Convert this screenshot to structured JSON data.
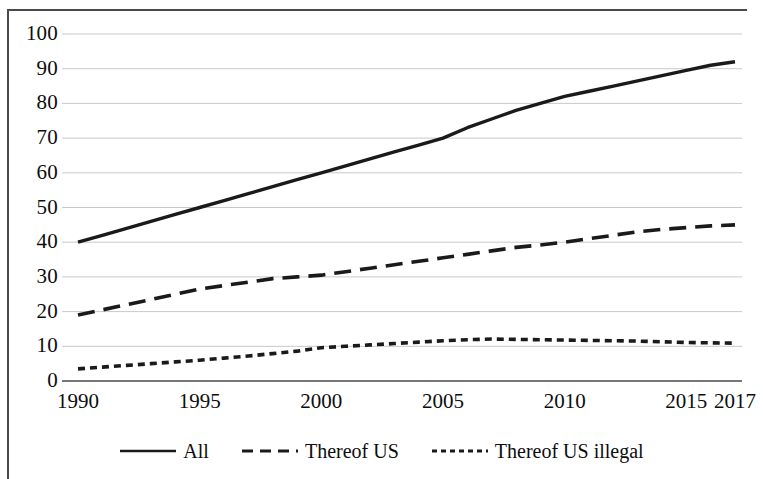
{
  "chart_data": {
    "type": "line",
    "title": "",
    "xlabel": "",
    "ylabel": "",
    "xlim": [
      1990,
      2017
    ],
    "ylim": [
      0,
      100
    ],
    "grid": true,
    "legend_position": "bottom",
    "x_tick_labels": [
      "1990",
      "1995",
      "2000",
      "2005",
      "2010",
      "2015",
      "2017"
    ],
    "x_tick_values": [
      1990,
      1995,
      2000,
      2005,
      2010,
      2015,
      2017
    ],
    "y_tick_labels": [
      "100",
      "90",
      "80",
      "70",
      "60",
      "50",
      "40",
      "30",
      "20",
      "10",
      "0"
    ],
    "y_tick_values": [
      100,
      90,
      80,
      70,
      60,
      50,
      40,
      30,
      20,
      10,
      0
    ],
    "x": [
      1990,
      1991,
      1992,
      1993,
      1994,
      1995,
      1996,
      1997,
      1998,
      1999,
      2000,
      2001,
      2002,
      2003,
      2004,
      2005,
      2006,
      2007,
      2008,
      2009,
      2010,
      2011,
      2012,
      2013,
      2014,
      2015,
      2016,
      2017
    ],
    "series": [
      {
        "name": "All",
        "style": "solid",
        "color": "#1a1a1a",
        "values": [
          40,
          42,
          44,
          46,
          48,
          50,
          52,
          54,
          56,
          58,
          60,
          62,
          64,
          66,
          68,
          70,
          73,
          75.5,
          78,
          80,
          82,
          83.5,
          85,
          86.5,
          88,
          89.5,
          91,
          92
        ]
      },
      {
        "name": "Thereof US",
        "style": "dashed",
        "color": "#1a1a1a",
        "values": [
          19,
          20.5,
          22,
          23.5,
          25,
          26.5,
          27.5,
          28.5,
          29.5,
          30,
          30.5,
          31.5,
          32.5,
          33.5,
          34.5,
          35.5,
          36.5,
          37.5,
          38.5,
          39.2,
          40,
          41,
          42,
          43,
          43.7,
          44.2,
          44.7,
          45
        ]
      },
      {
        "name": "Thereof US illegal",
        "style": "dotted",
        "color": "#1a1a1a",
        "values": [
          3.5,
          4,
          4.5,
          5,
          5.5,
          6,
          6.6,
          7.2,
          7.9,
          8.6,
          9.6,
          10,
          10.4,
          10.8,
          11.2,
          11.6,
          11.9,
          12.1,
          12,
          11.9,
          11.8,
          11.7,
          11.6,
          11.5,
          11.3,
          11.1,
          11,
          10.9
        ]
      }
    ]
  },
  "legend": {
    "items": [
      {
        "label": "All",
        "style": "solid"
      },
      {
        "label": "Thereof US",
        "style": "dashed"
      },
      {
        "label": "Thereof US illegal",
        "style": "dotted"
      }
    ]
  }
}
